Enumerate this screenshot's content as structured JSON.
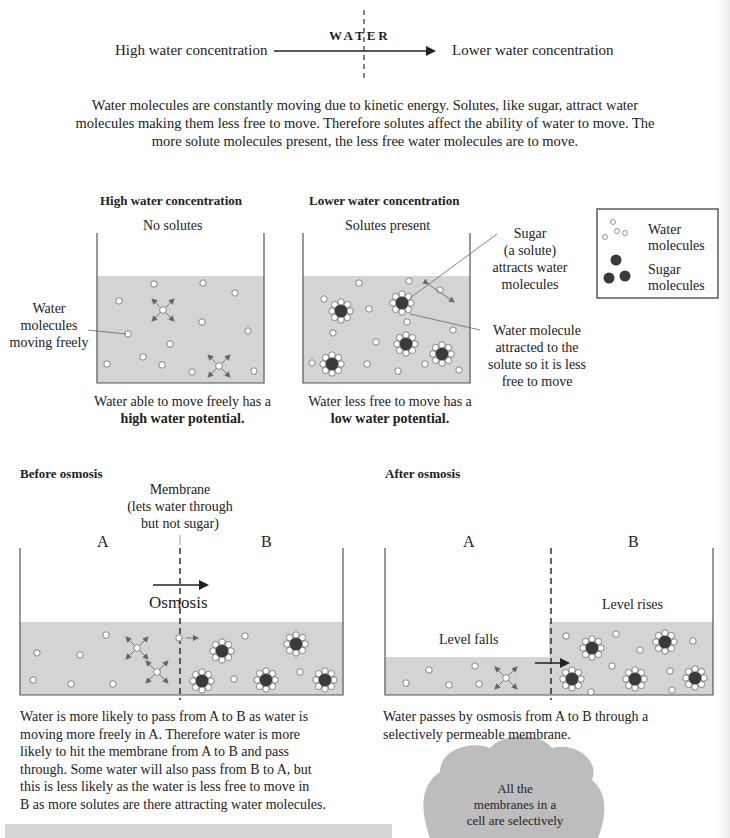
{
  "header_arrow": {
    "left_label": "High water concentration",
    "center_label": "WATER",
    "right_label": "Lower water concentration"
  },
  "intro_paragraph": {
    "line1": "Water molecules are constantly moving due to kinetic energy. Solutes, like sugar, attract water",
    "line2": "molecules making them less free to move. Therefore solutes affect the ability of water to move. The",
    "line3": "more solute molecules present, the less free water molecules are to move."
  },
  "beaker_high": {
    "title": "High water concentration",
    "subtitle": "No solutes",
    "annotation": [
      "Water",
      "molecules",
      "moving freely"
    ],
    "caption_line1": "Water able to move freely has a",
    "caption_line2": "high water potential."
  },
  "beaker_low": {
    "title": "Lower water concentration",
    "subtitle": "Solutes present",
    "annotation_sugar": [
      "Sugar",
      "(a solute)",
      "attracts water",
      "molecules"
    ],
    "annotation_water": [
      "Water molecule",
      "attracted to the",
      "solute so it is less",
      "free to move"
    ],
    "caption_line1": "Water less free to move has a",
    "caption_line2": "low water potential."
  },
  "legend": {
    "items": [
      {
        "icon": "water-molecules-icon",
        "label_line1": "Water",
        "label_line2": "molecules"
      },
      {
        "icon": "sugar-molecules-icon",
        "label_line1": "Sugar",
        "label_line2": "molecules"
      }
    ]
  },
  "before_osmosis": {
    "title": "Before osmosis",
    "membrane_label": [
      "Membrane",
      "(lets water through",
      "but not sugar)"
    ],
    "side_a": "A",
    "side_b": "B",
    "arrow_label": "Osmosis",
    "description": [
      "Water is more likely to pass from A to B as water is",
      "moving more freely in A. Therefore water is more",
      "likely to hit the membrane from A to B and pass",
      "through. Some water will also pass from B to A, but",
      "this is less likely as the water is less free to move in",
      "B as more solutes are there attracting water molecules."
    ]
  },
  "after_osmosis": {
    "title": "After osmosis",
    "side_a": "A",
    "side_b": "B",
    "level_a": "Level falls",
    "level_b": "Level rises",
    "description": [
      "Water passes by osmosis from A to B through a",
      "selectively permeable membrane."
    ]
  },
  "cloud_note": {
    "lines": [
      "All the",
      "membranes in a",
      "cell are selectively"
    ]
  },
  "colors": {
    "water_fill": "#d4d4d4",
    "sugar": "#3a3a3a",
    "line": "#555555",
    "text": "#222222",
    "cloud": "#bdbdbd",
    "note_box": "#d6d6d6"
  }
}
